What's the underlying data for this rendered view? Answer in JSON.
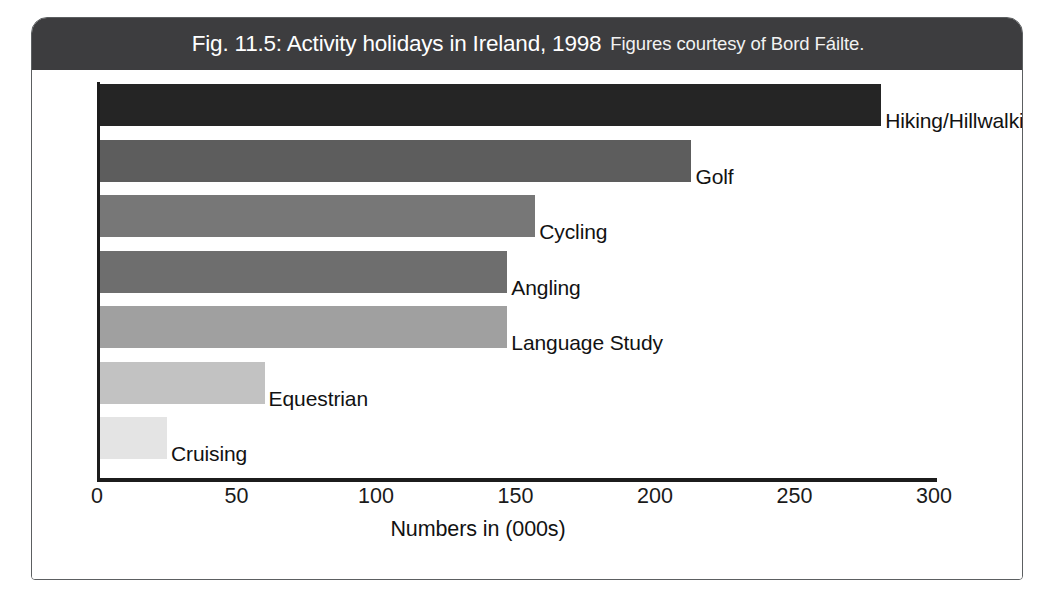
{
  "figure": {
    "title_main": "Fig. 11.5: Activity holidays in Ireland, 1998",
    "title_sub": "Figures courtesy of Bord Fáilte."
  },
  "chart_data": {
    "type": "bar",
    "orientation": "horizontal",
    "title": "Fig. 11.5: Activity holidays in Ireland, 1998",
    "subtitle": "Figures courtesy of Bord Fáilte.",
    "xlabel": "Numbers in (000s)",
    "ylabel": "",
    "xlim": [
      0,
      300
    ],
    "xticks": [
      0,
      50,
      100,
      150,
      200,
      250,
      300
    ],
    "xtick_labels": [
      "0",
      "50",
      "100",
      "150",
      "200",
      "250",
      "300"
    ],
    "grid": false,
    "legend": "none",
    "categories": [
      "Hiking/Hillwalking",
      "Golf",
      "Cycling",
      "Angling",
      "Language Study",
      "Equestrian",
      "Cruising"
    ],
    "values": [
      280,
      212,
      156,
      146,
      146,
      59,
      24
    ],
    "bar_colors": [
      "#252525",
      "#5d5d5d",
      "#777777",
      "#6e6e6e",
      "#a0a0a0",
      "#c2c2c2",
      "#e4e4e4"
    ],
    "bars": [
      {
        "label": "Hiking/Hillwalking",
        "value": 280,
        "color": "#252525"
      },
      {
        "label": "Golf",
        "value": 212,
        "color": "#5d5d5d"
      },
      {
        "label": "Cycling",
        "value": 156,
        "color": "#777777"
      },
      {
        "label": "Angling",
        "value": 146,
        "color": "#6e6e6e"
      },
      {
        "label": "Language Study",
        "value": 146,
        "color": "#a0a0a0"
      },
      {
        "label": "Equestrian",
        "value": 59,
        "color": "#c2c2c2"
      },
      {
        "label": "Cruising",
        "value": 24,
        "color": "#e4e4e4"
      }
    ]
  },
  "colors": {
    "title_bar": "#3d3d3f",
    "frame_border": "#5c5f61",
    "axis": "#1c1c1c",
    "background": "#ffffff"
  }
}
